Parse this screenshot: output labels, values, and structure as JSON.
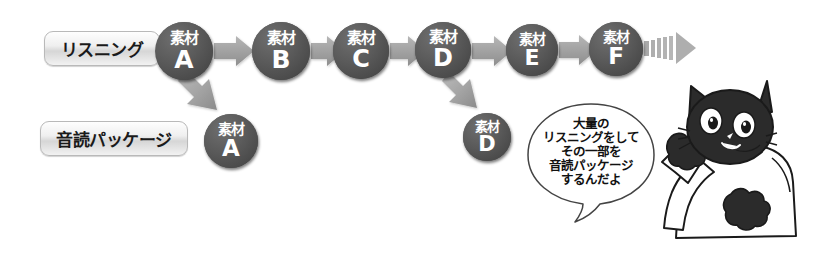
{
  "canvas": {
    "width": 816,
    "height": 264,
    "background": "#ffffff"
  },
  "theme": {
    "circle_fill": "#4e4e4e",
    "circle_text": "#ffffff",
    "arrow_fill": "#a0a0a0",
    "label_border": "#b9b9b9",
    "label_text": "#1a1a1a",
    "ink": "#1a1a1a"
  },
  "labels": [
    {
      "id": "listening",
      "text": "リスニング",
      "x": 44,
      "y": 31,
      "w": 114,
      "h": 33,
      "font_size": 17
    },
    {
      "id": "ondoku-package",
      "text": "音読パッケージ",
      "x": 40,
      "y": 121,
      "w": 146,
      "h": 33,
      "font_size": 17
    }
  ],
  "rows": {
    "listening_row_label": "リスニング",
    "package_row_label": "音読パッケージ"
  },
  "top_nodes": [
    {
      "id": "A",
      "kanji": "素材",
      "letter": "A",
      "cx": 184,
      "cy": 51,
      "r": 29
    },
    {
      "id": "B",
      "kanji": "素材",
      "letter": "B",
      "cx": 281,
      "cy": 51,
      "r": 29
    },
    {
      "id": "C",
      "kanji": "素材",
      "letter": "C",
      "cx": 361,
      "cy": 51,
      "r": 28
    },
    {
      "id": "D",
      "kanji": "素材",
      "letter": "D",
      "cx": 443,
      "cy": 50,
      "r": 28
    },
    {
      "id": "E",
      "kanji": "素材",
      "letter": "E",
      "cx": 532,
      "cy": 50,
      "r": 26
    },
    {
      "id": "F",
      "kanji": "素材",
      "letter": "F",
      "cx": 616,
      "cy": 49,
      "r": 27
    }
  ],
  "bottom_nodes": [
    {
      "id": "A2",
      "kanji": "素材",
      "letter": "A",
      "cx": 231,
      "cy": 141,
      "r": 27
    },
    {
      "id": "D2",
      "kanji": "素材",
      "letter": "D",
      "cx": 487,
      "cy": 137,
      "r": 24
    }
  ],
  "flow_arrows": [
    {
      "from": "A",
      "to": "B",
      "kind": "horizontal"
    },
    {
      "from": "B",
      "to": "C",
      "kind": "horizontal"
    },
    {
      "from": "C",
      "to": "D",
      "kind": "horizontal"
    },
    {
      "from": "D",
      "to": "E",
      "kind": "horizontal"
    },
    {
      "from": "E",
      "to": "F",
      "kind": "horizontal"
    },
    {
      "from": "F",
      "to": "continues",
      "kind": "fading-dashed"
    }
  ],
  "branch_arrows": [
    {
      "from": "A",
      "to": "A2",
      "kind": "diagonal-down"
    },
    {
      "from": "D",
      "to": "D2",
      "kind": "diagonal-down"
    }
  ],
  "speech_bubble": {
    "lines": [
      "大量の",
      "リスニングをして",
      "その一部を",
      "音読パッケージ",
      "するんだよ"
    ],
    "cx": 591,
    "cy": 158,
    "rx": 62,
    "ry": 54,
    "font_size": 12.5
  },
  "character": {
    "name": "black-cat",
    "description": "black cat wearing white shirt with raised paw",
    "body_fill": "#ffffff",
    "fur_fill": "#2b2b2b",
    "outline": "#1a1a1a"
  }
}
